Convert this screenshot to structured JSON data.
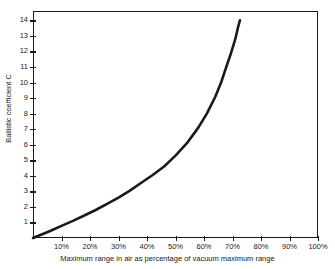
{
  "chart_data": {
    "type": "line",
    "title": "",
    "subtitle": "",
    "xlabel": "Maximum range in air as percentage of vacuum maximum range",
    "ylabel": "Ballistic coefficient C",
    "xlim": [
      0,
      100
    ],
    "ylim": [
      0,
      14.6
    ],
    "grid": false,
    "legend": null,
    "x_tick_labels": [
      "10%",
      "20%",
      "30%",
      "40%",
      "50%",
      "60%",
      "70%",
      "80%",
      "90%",
      "100%"
    ],
    "x_tick_values": [
      10,
      20,
      30,
      40,
      50,
      60,
      70,
      80,
      90,
      100
    ],
    "y_tick_labels": [
      "1",
      "2",
      "3",
      "4",
      "5",
      "6",
      "7",
      "8",
      "9",
      "10",
      "11",
      "12",
      "13",
      "14"
    ],
    "y_tick_values": [
      1,
      2,
      3,
      4,
      5,
      6,
      7,
      8,
      9,
      10,
      11,
      12,
      13,
      14
    ],
    "series": [
      {
        "name": "Ballistic coefficient curve",
        "color": "#1a1a1a",
        "line_width": 2.6,
        "x": [
          0,
          3,
          6,
          10,
          14,
          18,
          22,
          26,
          30,
          34,
          38,
          42,
          46,
          50,
          54,
          58,
          61,
          64,
          66,
          68,
          69.5,
          71,
          72,
          72.6
        ],
        "y": [
          0.0,
          0.22,
          0.45,
          0.78,
          1.1,
          1.45,
          1.8,
          2.2,
          2.6,
          3.05,
          3.55,
          4.05,
          4.6,
          5.3,
          6.1,
          7.1,
          8.0,
          9.1,
          10.0,
          11.1,
          11.9,
          12.8,
          13.6,
          14.0
        ]
      }
    ],
    "axis_color": "#1a1a1a",
    "background": "#ffffff"
  }
}
